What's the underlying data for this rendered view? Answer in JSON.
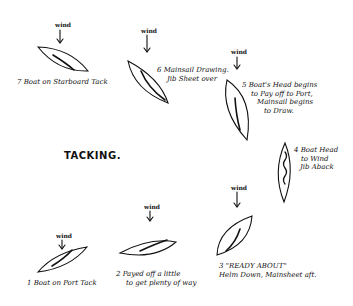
{
  "title": "TACKING.",
  "wind_label": "wind",
  "steps": [
    {
      "n": 1,
      "lines": [
        "1 Boat on Port Tack"
      ]
    },
    {
      "n": 2,
      "lines": [
        "2 Payed off a little",
        "to get plenty of way"
      ]
    },
    {
      "n": 3,
      "lines": [
        "3 \"READY ABOUT\"",
        "Helm Down, Mainsheet aft."
      ]
    },
    {
      "n": 4,
      "lines": [
        "4 Boat Head",
        "to Wind",
        "Jib Aback"
      ]
    },
    {
      "n": 5,
      "lines": [
        "5 Boat's Head begins",
        "to Pay off to Port,",
        "Mainsail begins",
        "to Draw."
      ]
    },
    {
      "n": 6,
      "lines": [
        "6 Mainsail Drawing.",
        "Jib Sheet over"
      ]
    },
    {
      "n": 7,
      "lines": [
        "7 Boat on Starboard Tack"
      ]
    }
  ]
}
